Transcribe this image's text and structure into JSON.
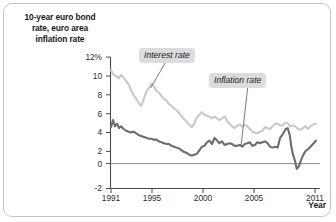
{
  "figure": {
    "title": "10-year euro bond rate, euro area inflation rate",
    "title_lines": [
      "10-year euro bond",
      "rate, euro area",
      "inflation rate"
    ],
    "xaxis_label": "Year"
  },
  "axes": {
    "y_ticks": [
      "12%",
      "10",
      "8",
      "6",
      "4",
      "2",
      "0",
      "-2"
    ],
    "x_ticks": [
      "1991",
      "1995",
      "2000",
      "2005",
      "2011"
    ]
  },
  "labels": {
    "interest": "Interest rate",
    "inflation": "Inflation rate"
  },
  "colors": {
    "interest_rate": "#c9c9c9",
    "inflation_rate": "#6d6d6d",
    "axis": "#4a4a4a",
    "frame": "#c4c4c4",
    "label_background": "#dcdcdc"
  },
  "chart_data": {
    "type": "line",
    "title": "10-year euro bond rate, euro area inflation rate",
    "xlabel": "Year",
    "ylabel": "10-year euro bond rate, euro area inflation rate",
    "xlim": [
      1991.0,
      2011.5
    ],
    "ylim": [
      -2,
      13
    ],
    "ytick_values": [
      12,
      10,
      8,
      6,
      4,
      2,
      0,
      -2
    ],
    "ytick_labels": [
      "12%",
      "10",
      "8",
      "6",
      "4",
      "2",
      "0",
      "-2"
    ],
    "xtick_values": [
      1991,
      1995,
      2000,
      2005,
      2011
    ],
    "xtick_labels": [
      "1991",
      "1995",
      "2000",
      "2005",
      "2011"
    ],
    "grid": false,
    "legend_position": "inline-annotation",
    "zero_line": 0,
    "series": [
      {
        "name": "Interest rate",
        "color": "#c9c9c9",
        "x": [
          1991.0,
          1991.25,
          1991.5,
          1991.75,
          1992.0,
          1992.25,
          1992.5,
          1992.75,
          1993.0,
          1993.25,
          1993.5,
          1993.75,
          1994.0,
          1994.25,
          1994.5,
          1994.75,
          1995.0,
          1995.25,
          1995.5,
          1995.75,
          1996.0,
          1996.25,
          1996.5,
          1996.75,
          1997.0,
          1997.25,
          1997.5,
          1997.75,
          1998.0,
          1998.25,
          1998.5,
          1998.75,
          1999.0,
          1999.25,
          1999.5,
          1999.75,
          2000.0,
          2000.25,
          2000.5,
          2000.75,
          2001.0,
          2001.25,
          2001.5,
          2001.75,
          2002.0,
          2002.25,
          2002.5,
          2002.75,
          2003.0,
          2003.25,
          2003.5,
          2003.75,
          2004.0,
          2004.25,
          2004.5,
          2004.75,
          2005.0,
          2005.25,
          2005.5,
          2005.75,
          2006.0,
          2006.25,
          2006.5,
          2006.75,
          2007.0,
          2007.25,
          2007.5,
          2007.75,
          2008.0,
          2008.25,
          2008.5,
          2008.75,
          2009.0,
          2009.25,
          2009.5,
          2009.75,
          2010.0,
          2010.25,
          2010.5,
          2010.75,
          2011.0,
          2011.3
        ],
        "values": [
          10.5,
          10.0,
          9.9,
          9.6,
          10.0,
          9.7,
          9.3,
          8.9,
          8.3,
          7.7,
          7.3,
          6.8,
          6.5,
          7.3,
          8.1,
          8.5,
          9.0,
          8.7,
          8.2,
          8.0,
          7.6,
          7.3,
          7.1,
          6.7,
          6.5,
          6.2,
          6.0,
          5.7,
          5.3,
          5.0,
          4.7,
          4.4,
          4.1,
          4.5,
          5.2,
          5.5,
          5.8,
          5.5,
          5.4,
          5.3,
          5.1,
          5.3,
          5.1,
          4.9,
          5.1,
          5.3,
          4.8,
          4.5,
          4.2,
          4.0,
          4.3,
          4.4,
          4.2,
          4.4,
          4.2,
          3.9,
          3.6,
          3.5,
          3.4,
          3.6,
          3.7,
          4.1,
          4.0,
          3.9,
          4.2,
          4.5,
          4.5,
          4.3,
          4.3,
          4.6,
          4.6,
          4.2,
          4.3,
          4.2,
          3.9,
          3.8,
          4.0,
          4.2,
          3.9,
          4.2,
          4.4,
          4.5
        ]
      },
      {
        "name": "Inflation rate",
        "color": "#6d6d6d",
        "x": [
          1991.0,
          1991.2,
          1991.4,
          1991.6,
          1991.8,
          1992.0,
          1992.25,
          1992.5,
          1992.75,
          1993.0,
          1993.25,
          1993.5,
          1993.75,
          1994.0,
          1994.25,
          1994.5,
          1994.75,
          1995.0,
          1995.25,
          1995.5,
          1995.75,
          1996.0,
          1996.25,
          1996.5,
          1996.75,
          1997.0,
          1997.25,
          1997.5,
          1997.75,
          1998.0,
          1998.25,
          1998.5,
          1998.75,
          1999.0,
          1999.25,
          1999.5,
          1999.75,
          2000.0,
          2000.25,
          2000.5,
          2000.75,
          2001.0,
          2001.25,
          2001.5,
          2001.75,
          2002.0,
          2002.25,
          2002.5,
          2002.75,
          2003.0,
          2003.25,
          2003.5,
          2003.75,
          2004.0,
          2004.25,
          2004.5,
          2004.75,
          2005.0,
          2005.25,
          2005.5,
          2005.75,
          2006.0,
          2006.25,
          2006.5,
          2006.75,
          2007.0,
          2007.25,
          2007.5,
          2007.75,
          2008.0,
          2008.15,
          2008.3,
          2008.5,
          2008.7,
          2008.85,
          2009.0,
          2009.2,
          2009.4,
          2009.6,
          2009.8,
          2010.0,
          2010.25,
          2010.5,
          2010.75,
          2011.0,
          2011.3
        ],
        "values": [
          4.1,
          4.9,
          4.2,
          4.5,
          4.0,
          4.2,
          3.9,
          3.7,
          3.6,
          3.5,
          3.6,
          3.4,
          3.2,
          3.1,
          3.0,
          2.9,
          2.8,
          2.8,
          2.7,
          2.7,
          2.5,
          2.4,
          2.3,
          2.2,
          2.2,
          2.0,
          1.9,
          1.8,
          1.7,
          1.5,
          1.3,
          1.2,
          1.0,
          0.9,
          1.0,
          1.1,
          1.5,
          1.9,
          2.0,
          2.4,
          2.6,
          2.2,
          2.9,
          2.6,
          2.3,
          2.5,
          2.1,
          2.2,
          2.3,
          2.2,
          2.0,
          2.0,
          2.1,
          1.9,
          2.2,
          2.3,
          2.4,
          2.0,
          2.1,
          2.4,
          2.3,
          2.4,
          2.5,
          2.3,
          1.9,
          1.8,
          1.9,
          1.8,
          2.9,
          3.3,
          3.6,
          3.9,
          4.0,
          3.2,
          2.0,
          1.1,
          0.4,
          -0.6,
          -0.3,
          0.3,
          0.9,
          1.4,
          1.6,
          1.9,
          2.2,
          2.6
        ]
      }
    ],
    "annotations": [
      {
        "text": "Interest rate",
        "x": 1995.6,
        "y": 11.6,
        "points_to": {
          "x": 1994.9,
          "y": 8.7
        }
      },
      {
        "text": "Inflation rate",
        "x": 2003.4,
        "y": 9.4,
        "points_to": {
          "x": 2004.2,
          "y": 2.3
        }
      }
    ]
  }
}
